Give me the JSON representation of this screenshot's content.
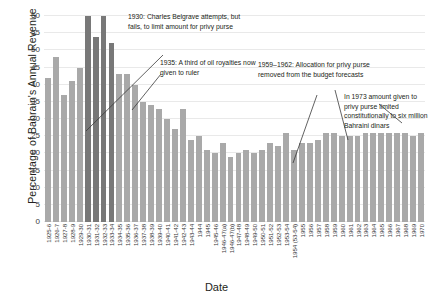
{
  "chart_data": {
    "type": "bar",
    "title": "",
    "xlabel": "Date",
    "ylabel": "Percentage of Bahrain's Annual Revenue",
    "ylim": [
      0,
      60
    ],
    "yticks": [
      0,
      5,
      10,
      15,
      20,
      25,
      30,
      35,
      40,
      45,
      50,
      55,
      60
    ],
    "grid": true,
    "legend": "none",
    "colors": {
      "bar": "#a9a9a9",
      "bar_highlight": "#787878"
    },
    "categories": [
      "1925-6",
      "1926-7",
      "1927-8",
      "1928-9",
      "1929-30",
      "1930-31",
      "1931-32",
      "1932-33",
      "1933-34",
      "1934-35",
      "1935-36",
      "1936-37",
      "1937-38",
      "1938-39",
      "1939-40",
      "1940-41",
      "1941-42",
      "1942-43",
      "1943-44",
      "1944",
      "1945",
      "1945-46",
      "1946-47(a)",
      "1946-47(b)",
      "1947-48",
      "1948-49",
      "1949-50",
      "1950-51",
      "1951-52",
      "1952-53",
      "1953-54",
      "1954 (53-54)",
      "1955",
      "1956",
      "1957",
      "1958",
      "1959",
      "1960",
      "1961",
      "1962",
      "1963",
      "1964",
      "1965",
      "1966",
      "1967",
      "1968",
      "1969",
      "1970"
    ],
    "values": [
      42,
      48,
      37,
      41,
      45,
      60,
      54,
      60,
      52,
      43,
      43,
      40,
      35,
      34,
      33,
      30,
      27,
      33,
      24,
      25,
      21,
      20,
      23,
      19,
      20,
      21,
      20,
      21,
      23,
      22,
      26,
      21,
      23,
      23,
      24,
      26,
      26,
      25,
      25,
      25,
      26,
      26,
      26,
      26,
      26,
      26,
      25,
      26
    ],
    "highlight_indices": [
      5,
      6,
      7,
      8
    ],
    "annotations": [
      {
        "id": "anno-1930",
        "text": "1930: Charles Belgrave attempts, but fails, to limit amount for privy purse"
      },
      {
        "id": "anno-1935",
        "text": "1935: A third of oil royalties now given to ruler"
      },
      {
        "id": "anno-1959",
        "text": "1959–1962: Allocation for privy purse removed from the budget forecasts"
      },
      {
        "id": "anno-1973",
        "text": "In 1973 amount given to privy purse limited constitutionally to six million Bahraini dinars"
      }
    ]
  }
}
